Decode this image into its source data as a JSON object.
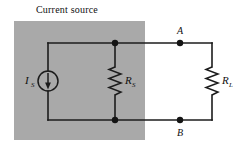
{
  "figure": {
    "title": "Current source",
    "background_color": "#ffffff",
    "shaded_region": {
      "name": "source-shaded-region",
      "fill_color": "#a9a9a9",
      "x": 14,
      "y": 21,
      "width": 131,
      "height": 119
    },
    "stroke_color": "#1c1c1c",
    "text_color": "#101010"
  },
  "components": {
    "current_source": {
      "label": "I",
      "subscript": "S",
      "symbol": "circle-with-down-arrow",
      "arrow_direction": "down",
      "cx": 48,
      "cy": 81,
      "r": 10
    },
    "source_resistor": {
      "label": "R",
      "subscript": "S",
      "symbol": "zigzag-resistor-vertical",
      "x": 115,
      "y_top": 67,
      "y_bottom": 95
    },
    "load_resistor": {
      "label": "R",
      "subscript": "L",
      "symbol": "zigzag-resistor-vertical",
      "x": 212,
      "y_top": 67,
      "y_bottom": 95
    }
  },
  "nodes": [
    {
      "name": "node-a",
      "label": "A",
      "x": 180,
      "y": 43,
      "label_position": "above"
    },
    {
      "name": "node-b",
      "label": "B",
      "x": 180,
      "y": 120,
      "label_position": "below"
    }
  ],
  "junctions": [
    {
      "name": "junction-top",
      "x": 115,
      "y": 43
    },
    {
      "name": "junction-bottom",
      "x": 115,
      "y": 120
    }
  ],
  "rails": {
    "top_y": 43,
    "bottom_y": 120,
    "left_x": 48,
    "right_x": 212
  }
}
